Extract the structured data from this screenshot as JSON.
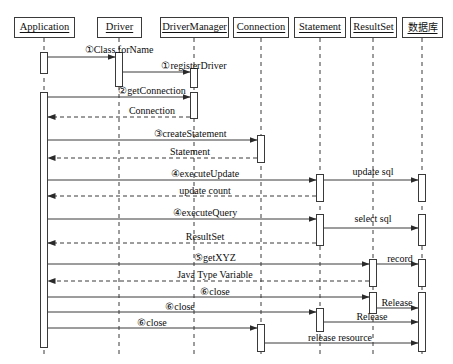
{
  "diagram": {
    "type": "uml-sequence",
    "width": 453,
    "height": 364,
    "stroke_color": "#3a3a3a",
    "text_color": "#101010",
    "background": "#ffffff"
  },
  "lifelines": [
    {
      "id": "application",
      "label": "Application",
      "x": 44,
      "box_x": 14,
      "box_w": 61,
      "cjk": false
    },
    {
      "id": "driver",
      "label": "Driver",
      "x": 119,
      "box_x": 97,
      "box_w": 45,
      "cjk": false
    },
    {
      "id": "drivermanager",
      "label": "DriverManager",
      "x": 194,
      "box_x": 160,
      "box_w": 69,
      "cjk": false
    },
    {
      "id": "connection",
      "label": "Connection",
      "x": 261,
      "box_x": 233,
      "box_w": 56,
      "cjk": false
    },
    {
      "id": "statement",
      "label": "Statement",
      "x": 320,
      "box_x": 294,
      "box_w": 52,
      "cjk": false
    },
    {
      "id": "resultset",
      "label": "ResultSet",
      "x": 373,
      "box_x": 350,
      "box_w": 47,
      "cjk": false
    },
    {
      "id": "database",
      "label": "数据库",
      "x": 422,
      "box_x": 402,
      "box_w": 41,
      "cjk": true
    }
  ],
  "messages": [
    {
      "id": "m1",
      "label": "①Class.forName",
      "from": "application",
      "to": "driver",
      "y": 57,
      "kind": "call",
      "label_x": 119,
      "label_y": 45
    },
    {
      "id": "m2",
      "label": "①registerDriver",
      "from": "driver",
      "to": "drivermanager",
      "y": 72,
      "kind": "call",
      "label_x": 194,
      "label_y": 61
    },
    {
      "id": "m3",
      "label": "②getConnection",
      "from": "application",
      "to": "drivermanager",
      "y": 97,
      "kind": "call",
      "label_x": 152,
      "label_y": 86
    },
    {
      "id": "m4",
      "label": "Connection",
      "from": "drivermanager",
      "to": "application",
      "y": 117,
      "kind": "return",
      "label_x": 152,
      "label_y": 106
    },
    {
      "id": "m5",
      "label": "③createStatement",
      "from": "application",
      "to": "connection",
      "y": 140,
      "kind": "call",
      "label_x": 190,
      "label_y": 129
    },
    {
      "id": "m6",
      "label": "Statement",
      "from": "connection",
      "to": "application",
      "y": 158,
      "kind": "return",
      "label_x": 190,
      "label_y": 147
    },
    {
      "id": "m7",
      "label": "④executeUpdate",
      "from": "application",
      "to": "statement",
      "y": 180,
      "kind": "call",
      "label_x": 205,
      "label_y": 169
    },
    {
      "id": "m8",
      "label": "update sql",
      "from": "statement",
      "to": "database",
      "y": 180,
      "kind": "call",
      "label_x": 373,
      "label_y": 167
    },
    {
      "id": "m9",
      "label": "update count",
      "from": "statement",
      "to": "application",
      "y": 196,
      "kind": "return",
      "label_x": 205,
      "label_y": 186
    },
    {
      "id": "m10",
      "label": "④executeQuery",
      "from": "application",
      "to": "statement",
      "y": 219,
      "kind": "call",
      "label_x": 205,
      "label_y": 208
    },
    {
      "id": "m11",
      "label": "select sql",
      "from": "statement",
      "to": "database",
      "y": 228,
      "kind": "call",
      "label_x": 373,
      "label_y": 214
    },
    {
      "id": "m12",
      "label": "ResultSet",
      "from": "statement",
      "to": "application",
      "y": 243,
      "kind": "return",
      "label_x": 205,
      "label_y": 232
    },
    {
      "id": "m13",
      "label": "⑤getXYZ",
      "from": "application",
      "to": "resultset",
      "y": 264,
      "kind": "call",
      "label_x": 215,
      "label_y": 253
    },
    {
      "id": "m14",
      "label": "record",
      "from": "resultset",
      "to": "database",
      "y": 264,
      "kind": "call",
      "label_x": 400,
      "label_y": 254
    },
    {
      "id": "m15",
      "label": "Java Type Variable",
      "from": "resultset",
      "to": "application",
      "y": 281,
      "kind": "return",
      "label_x": 215,
      "label_y": 270
    },
    {
      "id": "m16",
      "label": "⑥close",
      "from": "application",
      "to": "resultset",
      "y": 297,
      "kind": "call",
      "label_x": 215,
      "label_y": 287
    },
    {
      "id": "m17",
      "label": "Release",
      "from": "resultset",
      "to": "database",
      "y": 308,
      "kind": "call",
      "label_x": 397,
      "label_y": 298
    },
    {
      "id": "m18",
      "label": "⑥close",
      "from": "application",
      "to": "statement",
      "y": 312,
      "kind": "call",
      "label_x": 180,
      "label_y": 302
    },
    {
      "id": "m19",
      "label": "Release",
      "from": "statement",
      "to": "database",
      "y": 322,
      "kind": "call",
      "label_x": 372,
      "label_y": 312
    },
    {
      "id": "m20",
      "label": "⑥close",
      "from": "application",
      "to": "connection",
      "y": 328,
      "kind": "call",
      "label_x": 152,
      "label_y": 318
    },
    {
      "id": "m21",
      "label": "release resource",
      "from": "connection",
      "to": "database",
      "y": 343,
      "kind": "call",
      "label_x": 340,
      "label_y": 333
    }
  ],
  "activations": [
    {
      "id": "a-app-1",
      "lifeline": "application",
      "y": 52,
      "h": 22
    },
    {
      "id": "a-app-2",
      "lifeline": "application",
      "y": 92,
      "h": 256
    },
    {
      "id": "a-drv-1",
      "lifeline": "driver",
      "y": 52,
      "h": 35
    },
    {
      "id": "a-dm-1",
      "lifeline": "drivermanager",
      "y": 68,
      "h": 20
    },
    {
      "id": "a-dm-2",
      "lifeline": "drivermanager",
      "y": 92,
      "h": 27
    },
    {
      "id": "a-con-1",
      "lifeline": "connection",
      "y": 135,
      "h": 28
    },
    {
      "id": "a-con-2",
      "lifeline": "connection",
      "y": 324,
      "h": 28
    },
    {
      "id": "a-stm-1",
      "lifeline": "statement",
      "y": 174,
      "h": 28
    },
    {
      "id": "a-stm-2",
      "lifeline": "statement",
      "y": 214,
      "h": 32
    },
    {
      "id": "a-stm-3",
      "lifeline": "statement",
      "y": 308,
      "h": 24
    },
    {
      "id": "a-rs-1",
      "lifeline": "resultset",
      "y": 259,
      "h": 28
    },
    {
      "id": "a-rs-2",
      "lifeline": "resultset",
      "y": 292,
      "h": 22
    },
    {
      "id": "a-db-1",
      "lifeline": "database",
      "y": 174,
      "h": 28
    },
    {
      "id": "a-db-2",
      "lifeline": "database",
      "y": 214,
      "h": 32
    },
    {
      "id": "a-db-3",
      "lifeline": "database",
      "y": 259,
      "h": 28
    },
    {
      "id": "a-db-4",
      "lifeline": "database",
      "y": 292,
      "h": 60
    }
  ]
}
